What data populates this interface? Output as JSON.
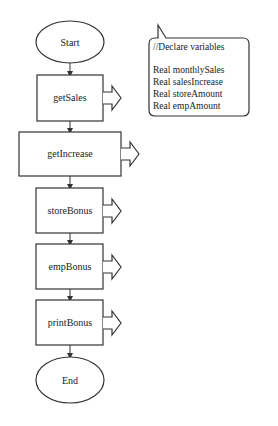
{
  "flowchart": {
    "start": {
      "label": "Start"
    },
    "steps": [
      {
        "label": "getSales"
      },
      {
        "label": "getIncrease"
      },
      {
        "label": "storeBonus"
      },
      {
        "label": "empBonus"
      },
      {
        "label": "printBonus"
      }
    ],
    "end": {
      "label": "End"
    }
  },
  "note": {
    "lines": [
      "//Declare variables",
      "",
      "Real monthlySales",
      "Real salesIncrease",
      "Real storeAmount",
      "Real empAmount"
    ]
  },
  "colors": {
    "stroke": "#333333",
    "background": "#ffffff",
    "text": "#222222"
  }
}
